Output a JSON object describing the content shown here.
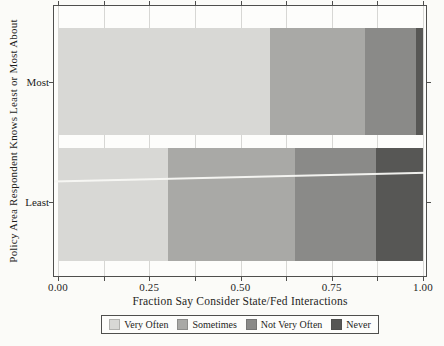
{
  "chart_data": {
    "type": "bar",
    "orientation": "horizontal",
    "stacked": true,
    "title": "",
    "xlabel": "Fraction Say Consider State/Fed Interactions",
    "ylabel": "Policy Area Respondent Knows Least or Most About",
    "categories": [
      "Most",
      "Least"
    ],
    "series": [
      {
        "name": "Very Often",
        "color": "#d8d8d5",
        "values": [
          0.58,
          0.3
        ]
      },
      {
        "name": "Sometimes",
        "color": "#a9a9a6",
        "values": [
          0.26,
          0.35
        ]
      },
      {
        "name": "Not Very Often",
        "color": "#8a8a88",
        "values": [
          0.14,
          0.22
        ]
      },
      {
        "name": "Never",
        "color": "#575755",
        "values": [
          0.02,
          0.13
        ]
      }
    ],
    "xlim": [
      0,
      1
    ],
    "x_major_ticks": [
      0,
      0.25,
      0.5,
      0.75,
      1
    ],
    "x_tick_labels": [
      "0.00",
      "0.25",
      "0.50",
      "0.75",
      "1.00"
    ],
    "x_minor_tick_step": 0.125,
    "grid": "vertical gridlines every 0.125",
    "ticks_mirrored": "ticks drawn on top, bottom, left and right panel edges",
    "legend_position": "bottom, boxed"
  }
}
